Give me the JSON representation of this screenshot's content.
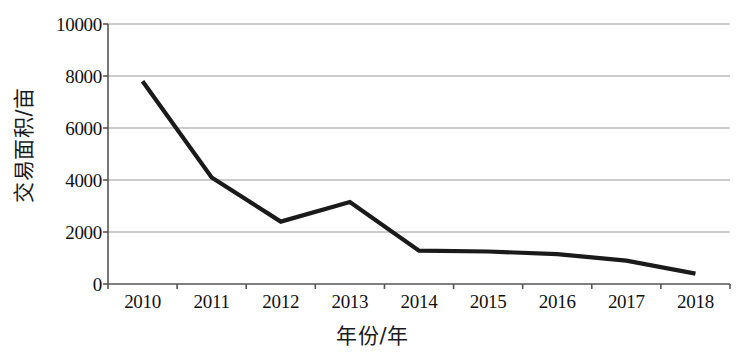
{
  "chart_data": {
    "type": "line",
    "title": "",
    "xlabel": "年份/年",
    "ylabel": "交易面积/亩",
    "categories": [
      "2010",
      "2011",
      "2012",
      "2013",
      "2014",
      "2015",
      "2016",
      "2017",
      "2018"
    ],
    "values": [
      7800,
      4100,
      2400,
      3150,
      1280,
      1250,
      1150,
      900,
      400
    ],
    "series": [
      {
        "name": "交易面积",
        "values": [
          7800,
          4100,
          2400,
          3150,
          1280,
          1250,
          1150,
          900,
          400
        ]
      }
    ],
    "ylim": [
      0,
      10000
    ],
    "y_ticks": [
      0,
      2000,
      4000,
      6000,
      8000,
      10000
    ],
    "y_tick_labels": [
      "0",
      "2000",
      "4000",
      "6000",
      "8000",
      "10000"
    ],
    "x_tick_labels": [
      "2010",
      "2011",
      "2012",
      "2013",
      "2014",
      "2015",
      "2016",
      "2017",
      "2018"
    ],
    "grid": "horizontal",
    "legend": "none",
    "line_color": "#1a1a1a",
    "gridline_color": "#999999",
    "axis_color": "#555555"
  },
  "axes": {
    "y_title": "交易面积/亩",
    "x_title": "年份/年"
  }
}
